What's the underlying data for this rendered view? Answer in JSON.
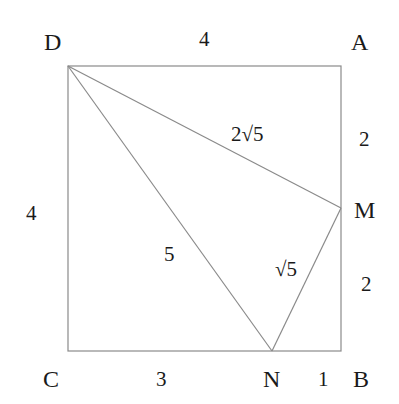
{
  "diagram": {
    "points": {
      "A": {
        "label": "A",
        "x": 341,
        "y": 66
      },
      "B": {
        "label": "B",
        "x": 341,
        "y": 351
      },
      "C": {
        "label": "C",
        "x": 68,
        "y": 351
      },
      "D": {
        "label": "D",
        "x": 68,
        "y": 66
      },
      "M": {
        "label": "M",
        "x": 341,
        "y": 208
      },
      "N": {
        "label": "N",
        "x": 272,
        "y": 351
      }
    },
    "segment_labels": {
      "DA": "4",
      "DC": "4",
      "AM": "2",
      "MB": "2",
      "CN": "3",
      "NB": "1",
      "DM": "2√5",
      "DN": "5",
      "MN": "√5"
    },
    "colors": {
      "line": "#8a8a8a",
      "text": "#1a1a1a",
      "background": "#ffffff"
    }
  }
}
